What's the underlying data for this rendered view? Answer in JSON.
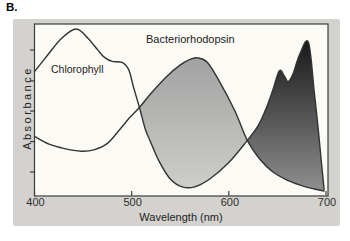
{
  "figure_label": "B.",
  "labels": {
    "chlorophyll": "Chlorophyll",
    "bacteriorhodopsin": "Bacteriorhodopsin"
  },
  "chart_data": {
    "type": "area",
    "title": "",
    "xlabel": "Wavelength (nm)",
    "ylabel": "Absorbance",
    "xlim": [
      400,
      700
    ],
    "ylim_rel": [
      0,
      1
    ],
    "x_ticks": [
      400,
      500,
      600,
      700
    ],
    "y_ticks_rel": [
      0.144,
      0.326,
      0.509,
      0.689,
      0.874
    ],
    "grid": false,
    "legend": "inline-labels",
    "series": [
      {
        "name": "Chlorophyll",
        "style": "line",
        "points": [
          [
            400,
            0.745
          ],
          [
            413,
            0.84
          ],
          [
            428,
            0.945
          ],
          [
            443,
            1.0
          ],
          [
            455,
            0.945
          ],
          [
            465,
            0.875
          ],
          [
            472,
            0.83
          ],
          [
            480,
            0.806
          ],
          [
            490,
            0.8
          ],
          [
            497,
            0.755
          ],
          [
            502,
            0.65
          ],
          [
            508,
            0.53
          ],
          [
            514,
            0.4
          ],
          [
            519,
            0.33
          ],
          [
            528,
            0.21
          ],
          [
            540,
            0.1
          ],
          [
            552,
            0.055
          ],
          [
            565,
            0.055
          ],
          [
            580,
            0.1
          ],
          [
            600,
            0.2
          ],
          [
            619,
            0.333
          ],
          [
            630,
            0.42
          ],
          [
            638,
            0.52
          ],
          [
            645,
            0.63
          ],
          [
            652,
            0.75
          ],
          [
            657,
            0.72
          ],
          [
            661,
            0.685
          ],
          [
            666,
            0.73
          ],
          [
            673,
            0.85
          ],
          [
            682,
            0.92
          ],
          [
            688,
            0.62
          ],
          [
            692,
            0.4
          ],
          [
            695,
            0.22
          ],
          [
            698,
            0.04
          ]
        ]
      },
      {
        "name": "Bacteriorhodopsin",
        "style": "line",
        "points": [
          [
            400,
            0.357
          ],
          [
            415,
            0.31
          ],
          [
            430,
            0.285
          ],
          [
            448,
            0.268
          ],
          [
            462,
            0.278
          ],
          [
            475,
            0.315
          ],
          [
            488,
            0.4
          ],
          [
            498,
            0.47
          ],
          [
            508,
            0.53
          ],
          [
            520,
            0.615
          ],
          [
            535,
            0.71
          ],
          [
            550,
            0.785
          ],
          [
            560,
            0.818
          ],
          [
            568,
            0.827
          ],
          [
            578,
            0.8
          ],
          [
            590,
            0.69
          ],
          [
            606,
            0.512
          ],
          [
            619,
            0.333
          ],
          [
            632,
            0.22
          ],
          [
            645,
            0.145
          ],
          [
            660,
            0.095
          ],
          [
            675,
            0.062
          ],
          [
            688,
            0.042
          ],
          [
            698,
            0.03
          ]
        ]
      }
    ],
    "fills": [
      {
        "name": "bacteriorhodopsin-gap-fill",
        "upper": "Bacteriorhodopsin",
        "lower": "Chlorophyll",
        "range": [
          508,
          619
        ],
        "gradient": [
          "#a2a2a2",
          "#cdcdca"
        ]
      },
      {
        "name": "chlorophyll-red-peak-fill",
        "upper": "Chlorophyll",
        "lower": "Bacteriorhodopsin",
        "range": [
          619,
          698
        ],
        "gradient": [
          "#191919",
          "#8f8f8f"
        ]
      }
    ],
    "colors": {
      "curve": "#333333",
      "axis": "#3c3c3c",
      "tick_label": "#2f2f2f",
      "panel_bg": "#d3d2ce",
      "plot_bg": "#fbfaf5",
      "page_bg": "#ffffff"
    }
  }
}
